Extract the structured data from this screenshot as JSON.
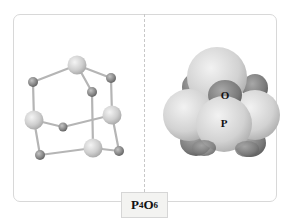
{
  "figure": {
    "formula": {
      "element1": "P",
      "sub1": "4",
      "element2": "O",
      "sub2": "6"
    },
    "left_panel": {
      "model": "ball-and-stick",
      "atoms": [
        {
          "id": "P1",
          "type": "P",
          "x": 77,
          "y": 65
        },
        {
          "id": "P2",
          "type": "P",
          "x": 34,
          "y": 120
        },
        {
          "id": "P3",
          "type": "P",
          "x": 112,
          "y": 115
        },
        {
          "id": "P4",
          "type": "P",
          "x": 93,
          "y": 148
        },
        {
          "id": "O1",
          "type": "O",
          "x": 33,
          "y": 82
        },
        {
          "id": "O2",
          "type": "O",
          "x": 111,
          "y": 78
        },
        {
          "id": "O3",
          "type": "O",
          "x": 92,
          "y": 92
        },
        {
          "id": "O4",
          "type": "O",
          "x": 63,
          "y": 127
        },
        {
          "id": "O5",
          "type": "O",
          "x": 40,
          "y": 155
        },
        {
          "id": "O6",
          "type": "O",
          "x": 119,
          "y": 151
        }
      ]
    },
    "right_panel": {
      "model": "space-filling",
      "labels": {
        "oxygen": "O",
        "phosphorus": "P"
      }
    },
    "colors": {
      "phosphorus": "#d0d0d0",
      "oxygen": "#8c8c8c",
      "bond": "#b8b8b8",
      "panel_border": "#d8d8d8",
      "label_bg": "#f3f3f1"
    }
  }
}
